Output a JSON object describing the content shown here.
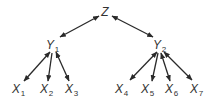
{
  "diagram": {
    "type": "hierarchical-factor-tree",
    "colors": {
      "line": "#2a2a2a",
      "text": "#333333",
      "background": "#ffffff"
    },
    "nodes": [
      {
        "id": "Z",
        "base": "Z",
        "sub": ""
      },
      {
        "id": "Y1",
        "base": "Y",
        "sub": "1"
      },
      {
        "id": "Y2",
        "base": "Y",
        "sub": "2"
      },
      {
        "id": "X1",
        "base": "X",
        "sub": "1"
      },
      {
        "id": "X2",
        "base": "X",
        "sub": "2"
      },
      {
        "id": "X3",
        "base": "X",
        "sub": "3"
      },
      {
        "id": "X4",
        "base": "X",
        "sub": "4"
      },
      {
        "id": "X5",
        "base": "X",
        "sub": "5"
      },
      {
        "id": "X6",
        "base": "X",
        "sub": "6"
      },
      {
        "id": "X7",
        "base": "X",
        "sub": "7"
      }
    ],
    "edges": [
      {
        "from": "Z",
        "to": "Y1",
        "arrows": "both"
      },
      {
        "from": "Z",
        "to": "Y2",
        "arrows": "both"
      },
      {
        "from": "Y1",
        "to": "X1",
        "arrows": "both"
      },
      {
        "from": "Y1",
        "to": "X2",
        "arrows": "end"
      },
      {
        "from": "Y1",
        "to": "X3",
        "arrows": "both"
      },
      {
        "from": "Y2",
        "to": "X4",
        "arrows": "both"
      },
      {
        "from": "Y2",
        "to": "X5",
        "arrows": "end"
      },
      {
        "from": "Y2",
        "to": "X6",
        "arrows": "both"
      },
      {
        "from": "Y2",
        "to": "X7",
        "arrows": "both"
      }
    ]
  }
}
